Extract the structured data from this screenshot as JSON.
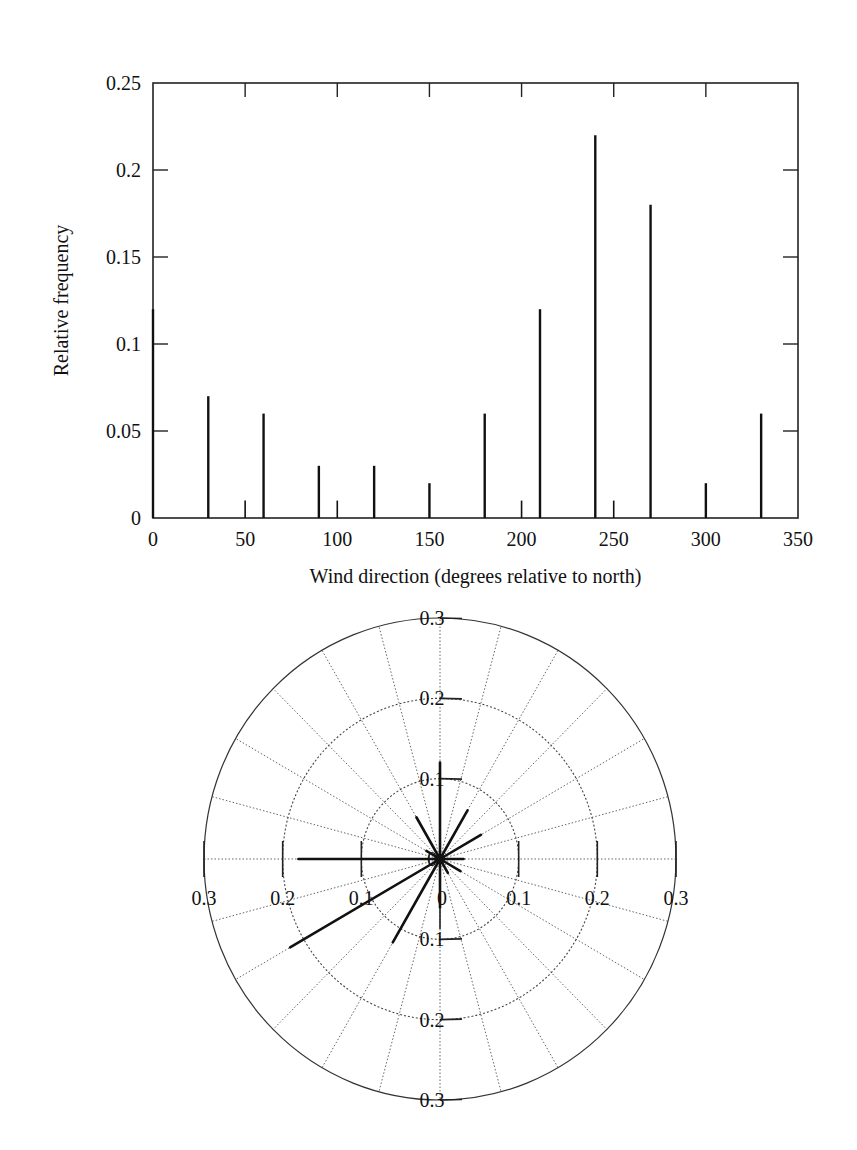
{
  "chart_data": [
    {
      "type": "bar",
      "style": "stem",
      "title": "",
      "xlabel": "Wind direction (degrees relative to north)",
      "ylabel": "Relative frequency",
      "xlim": [
        0,
        350
      ],
      "ylim": [
        0,
        0.25
      ],
      "xticks": [
        0,
        50,
        100,
        150,
        200,
        250,
        300,
        350
      ],
      "xtick_labels": [
        "0",
        "50",
        "100",
        "150",
        "200",
        "250",
        "300",
        "350"
      ],
      "yticks": [
        0,
        0.05,
        0.1,
        0.15,
        0.2,
        0.25
      ],
      "ytick_labels": [
        "0",
        "0.05",
        "0.1",
        "0.15",
        "0.2",
        "0.25"
      ],
      "grid": false,
      "series": [
        {
          "name": "main directions",
          "x": [
            0,
            30,
            60,
            90,
            120,
            150,
            180,
            210,
            240,
            270,
            300,
            330
          ],
          "values": [
            0.12,
            0.07,
            0.06,
            0.03,
            0.03,
            0.02,
            0.06,
            0.12,
            0.22,
            0.18,
            0.02,
            0.06
          ]
        },
        {
          "name": "minor bins",
          "x": [
            50,
            100,
            200,
            250
          ],
          "values": [
            0.01,
            0.01,
            0.01,
            0.01
          ]
        }
      ]
    },
    {
      "type": "polar",
      "style": "compass-stem",
      "orientation": "north-up, clockwise",
      "rlim": [
        0,
        0.3
      ],
      "rings": [
        0.1,
        0.2,
        0.3
      ],
      "ring_labels": [
        "0.1",
        "0.2",
        "0.3"
      ],
      "center_label": "0",
      "spoke_step_degrees": 15,
      "grid": true,
      "directions": [
        0,
        30,
        60,
        90,
        120,
        150,
        180,
        210,
        240,
        270,
        300,
        330
      ],
      "values": [
        0.12,
        0.07,
        0.06,
        0.03,
        0.03,
        0.02,
        0.06,
        0.12,
        0.22,
        0.18,
        0.02,
        0.06
      ]
    }
  ]
}
